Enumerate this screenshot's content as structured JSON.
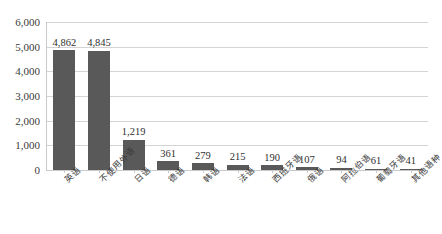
{
  "chart_data": {
    "type": "bar",
    "title": "",
    "subtitle": "",
    "xlabel": "",
    "ylabel": "",
    "categories": [
      "英语",
      "不使用外语",
      "日语",
      "德语",
      "韩语",
      "法语",
      "西班牙语",
      "俄语",
      "阿拉伯语",
      "葡萄牙语",
      "其他语种"
    ],
    "values": [
      4862,
      4845,
      1219,
      361,
      279,
      215,
      190,
      107,
      94,
      61,
      41
    ],
    "value_labels": [
      "4,862",
      "4,845",
      "1,219",
      "361",
      "279",
      "215",
      "190",
      "107",
      "94",
      "61",
      "41"
    ],
    "ylim": [
      0,
      6000
    ],
    "y_ticks": [
      0,
      1000,
      2000,
      3000,
      4000,
      5000,
      6000
    ],
    "y_tick_labels": [
      "0",
      "1,000",
      "2,000",
      "3,000",
      "4,000",
      "5,000",
      "6,000"
    ],
    "grid": true,
    "legend": false,
    "legend_position": "none",
    "bar_color": "#595959",
    "gridline_color": "#d4d4d4",
    "axis_color": "#c9c9c9",
    "label_rotation": -45
  }
}
